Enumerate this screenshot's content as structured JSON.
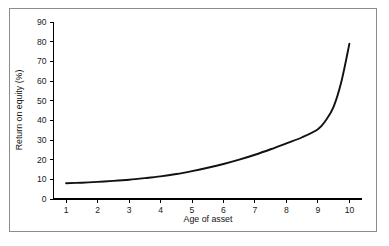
{
  "figure": {
    "background_color": "#ffffff",
    "frame_color": "#8c8c8c",
    "curve_color": "#111111",
    "axis_color": "#000000"
  },
  "chart_data": {
    "type": "line",
    "title": "",
    "subtitle": "",
    "xlabel": "Age of asset",
    "ylabel": "Return on equity (%)",
    "xlim": [
      0.6,
      10.4
    ],
    "ylim": [
      0,
      90
    ],
    "xticks": [
      1,
      2,
      3,
      4,
      5,
      6,
      7,
      8,
      9,
      10
    ],
    "xtick_labels": [
      "1",
      "2",
      "3",
      "4",
      "5",
      "6",
      "7",
      "8",
      "9",
      "10"
    ],
    "yticks": [
      0,
      10,
      20,
      30,
      40,
      50,
      60,
      70,
      80,
      90
    ],
    "ytick_labels": [
      "0",
      "10",
      "20",
      "30",
      "40",
      "50",
      "60",
      "70",
      "80",
      "90"
    ],
    "grid": false,
    "legend": null,
    "legend_position": "none",
    "annotations": [],
    "x": [
      1,
      1.5,
      2,
      2.5,
      3,
      3.5,
      4,
      4.5,
      5,
      5.5,
      6,
      6.5,
      7,
      7.5,
      8,
      8.5,
      9,
      9.25,
      9.5,
      9.75,
      10
    ],
    "values": [
      8,
      8.3,
      8.7,
      9.2,
      9.8,
      10.6,
      11.5,
      12.7,
      14.2,
      15.9,
      17.8,
      20.0,
      22.5,
      25.3,
      28.3,
      31.4,
      35.5,
      40.0,
      47.0,
      60.0,
      79.0
    ],
    "series": [
      {
        "name": "Return on equity",
        "values": [
          8,
          8.3,
          8.7,
          9.2,
          9.8,
          10.6,
          11.5,
          12.7,
          14.2,
          15.9,
          17.8,
          20.0,
          22.5,
          25.3,
          28.3,
          31.4,
          35.5,
          40.0,
          47.0,
          60.0,
          79.0
        ]
      }
    ]
  }
}
